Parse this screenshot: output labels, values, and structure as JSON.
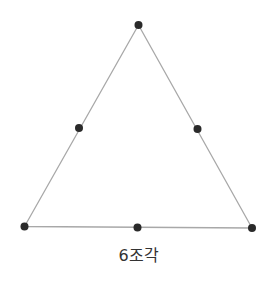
{
  "diagram": {
    "caption": "6조각",
    "colors": {
      "edge": "#a8a8a8",
      "point": "#2a2a2a",
      "caption": "#333333",
      "background": "#ffffff"
    },
    "triangle": {
      "vertices": [
        {
          "name": "top",
          "x": 138.5,
          "y": 25
        },
        {
          "name": "bottom-left",
          "x": 24.5,
          "y": 226.5
        },
        {
          "name": "bottom-right",
          "x": 252,
          "y": 228
        }
      ]
    },
    "points": [
      {
        "name": "top-vertex",
        "x": 138.5,
        "y": 25
      },
      {
        "name": "left-midpoint",
        "x": 79,
        "y": 128
      },
      {
        "name": "right-midpoint",
        "x": 197.5,
        "y": 129
      },
      {
        "name": "bottom-left-vertex",
        "x": 24.5,
        "y": 226.5
      },
      {
        "name": "bottom-midpoint",
        "x": 137.5,
        "y": 227.5
      },
      {
        "name": "bottom-right-vertex",
        "x": 252,
        "y": 228
      }
    ],
    "point_radius": 4
  }
}
